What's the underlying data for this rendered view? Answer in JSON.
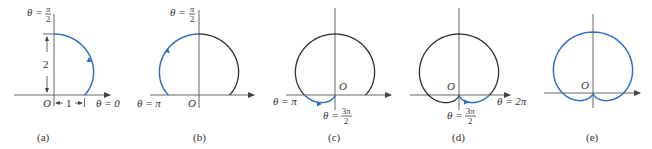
{
  "figure": {
    "curve": "r = 1 + sin(theta)",
    "colors": {
      "axis": "#555555",
      "curve": "#2b2b2b",
      "highlight": "#2f6fc2"
    },
    "panels": [
      {
        "id": "a",
        "caption": "(a)",
        "origin_label": "O",
        "theta_traced": [
          0,
          1.5707963
        ],
        "show_full": false,
        "labels": {
          "top": {
            "theta": "θ =",
            "num": "π",
            "den": "2"
          },
          "right": "θ = 0",
          "height_dim": "2",
          "width_dim": "1"
        }
      },
      {
        "id": "b",
        "caption": "(b)",
        "origin_label": "O",
        "theta_traced": [
          1.5707963,
          3.1415927
        ],
        "show_full": false,
        "labels": {
          "top": {
            "theta": "θ =",
            "num": "π",
            "den": "2"
          },
          "left": "θ = π"
        }
      },
      {
        "id": "c",
        "caption": "(c)",
        "origin_label": "O",
        "theta_traced": [
          3.1415927,
          4.712389
        ],
        "show_full": false,
        "labels": {
          "left": "θ = π",
          "bottom": {
            "theta": "θ =",
            "num": "3π",
            "den": "2"
          }
        }
      },
      {
        "id": "d",
        "caption": "(d)",
        "origin_label": "O",
        "theta_traced": [
          4.712389,
          6.2831853
        ],
        "show_full": false,
        "labels": {
          "right": "θ = 2π",
          "bottom": {
            "theta": "θ =",
            "num": "3π",
            "den": "2"
          }
        }
      },
      {
        "id": "e",
        "caption": "(e)",
        "origin_label": "O",
        "theta_traced": [
          0,
          6.2831853
        ],
        "show_full": true,
        "labels": {}
      }
    ]
  }
}
